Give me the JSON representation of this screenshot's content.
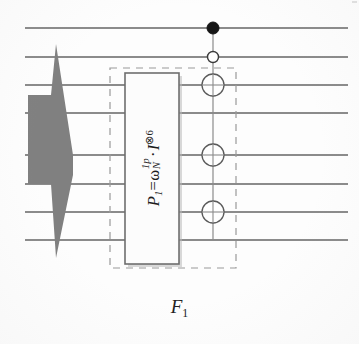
{
  "figure": {
    "caption": "F",
    "caption_sub": "1",
    "alt_title": "Butterfly stage diagram with twiddle-factor processing block"
  },
  "process_box": {
    "formula_plain": "P1 = wN^1p . I^(x)6",
    "label_P": "P",
    "label_P_sub": "1",
    "equals": "=",
    "omega": "ω",
    "omega_sub": "N",
    "omega_sup": "1p",
    "operator_dot": "·",
    "identity": "I",
    "tensor_power": "⊗6"
  },
  "colors": {
    "shape_fill": "#808080",
    "line": "#8b8b8b",
    "dashed": "#9a9a9a",
    "box_stroke": "#6e6e6e",
    "box_fill": "#fcfcfc",
    "node_filled": "#161616",
    "node_open_stroke": "#4d4d4d",
    "text": "#1d1d1d",
    "background": "#fdfdfd"
  },
  "geometry": {
    "width": 359,
    "height": 344,
    "signal_lines_y": [
      28,
      57,
      85,
      113,
      155,
      184,
      212,
      240
    ],
    "signal_line_x_start": 25,
    "signal_line_x_end": 348,
    "bus_x": 213,
    "dashed_rect": {
      "x": 110,
      "y": 68,
      "w": 126,
      "h": 200
    },
    "solid_box": {
      "x": 125,
      "y": 73,
      "w": 54,
      "h": 191
    }
  },
  "nodes": [
    {
      "name": "filled-dot-node",
      "x": 213,
      "y": 28,
      "r": 6,
      "style": "filled"
    },
    {
      "name": "open-small-node",
      "x": 213,
      "y": 57,
      "r": 5.5,
      "style": "open-small"
    },
    {
      "name": "crossed-node-1",
      "x": 213,
      "y": 85,
      "r": 11,
      "style": "open-large"
    },
    {
      "name": "crossed-node-2",
      "x": 213,
      "y": 155,
      "r": 11,
      "style": "open-large"
    },
    {
      "name": "crossed-node-3",
      "x": 213,
      "y": 212,
      "r": 11,
      "style": "open-large"
    }
  ]
}
